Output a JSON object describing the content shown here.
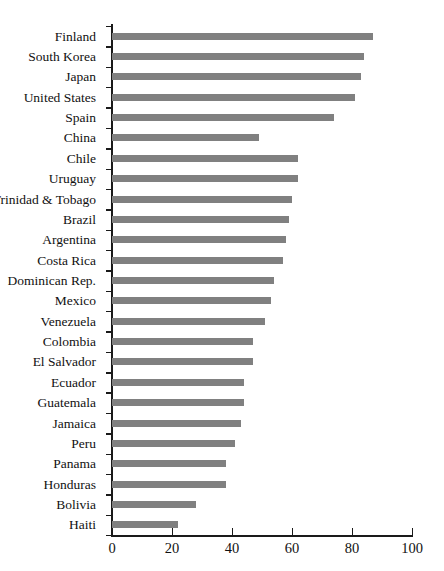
{
  "chart_data": {
    "type": "bar",
    "orientation": "horizontal",
    "title": "",
    "subtitle": "",
    "xlabel": "",
    "ylabel": "",
    "xlim": [
      0,
      100
    ],
    "ylim": null,
    "grid": false,
    "legend": null,
    "bar_color": "#808080",
    "axis_color": "#1a1a1a",
    "xticks": [
      0,
      20,
      40,
      60,
      80,
      100
    ],
    "xtick_labels": [
      "0",
      "20",
      "40",
      "60",
      "80",
      "100"
    ],
    "categories": [
      "Finland",
      "South Korea",
      "Japan",
      "United States",
      "Spain",
      "China",
      "Chile",
      "Uruguay",
      "Trinidad & Tobago",
      "Brazil",
      "Argentina",
      "Costa Rica",
      "Dominican Rep.",
      "Mexico",
      "Venezuela",
      "Colombia",
      "El Salvador",
      "Ecuador",
      "Guatemala",
      "Jamaica",
      "Peru",
      "Panama",
      "Honduras",
      "Bolivia",
      "Haiti"
    ],
    "values": [
      87,
      84,
      83,
      81,
      74,
      49,
      62,
      62,
      60,
      59,
      58,
      57,
      54,
      53,
      51,
      47,
      47,
      44,
      44,
      43,
      41,
      38,
      38,
      28,
      22
    ]
  }
}
